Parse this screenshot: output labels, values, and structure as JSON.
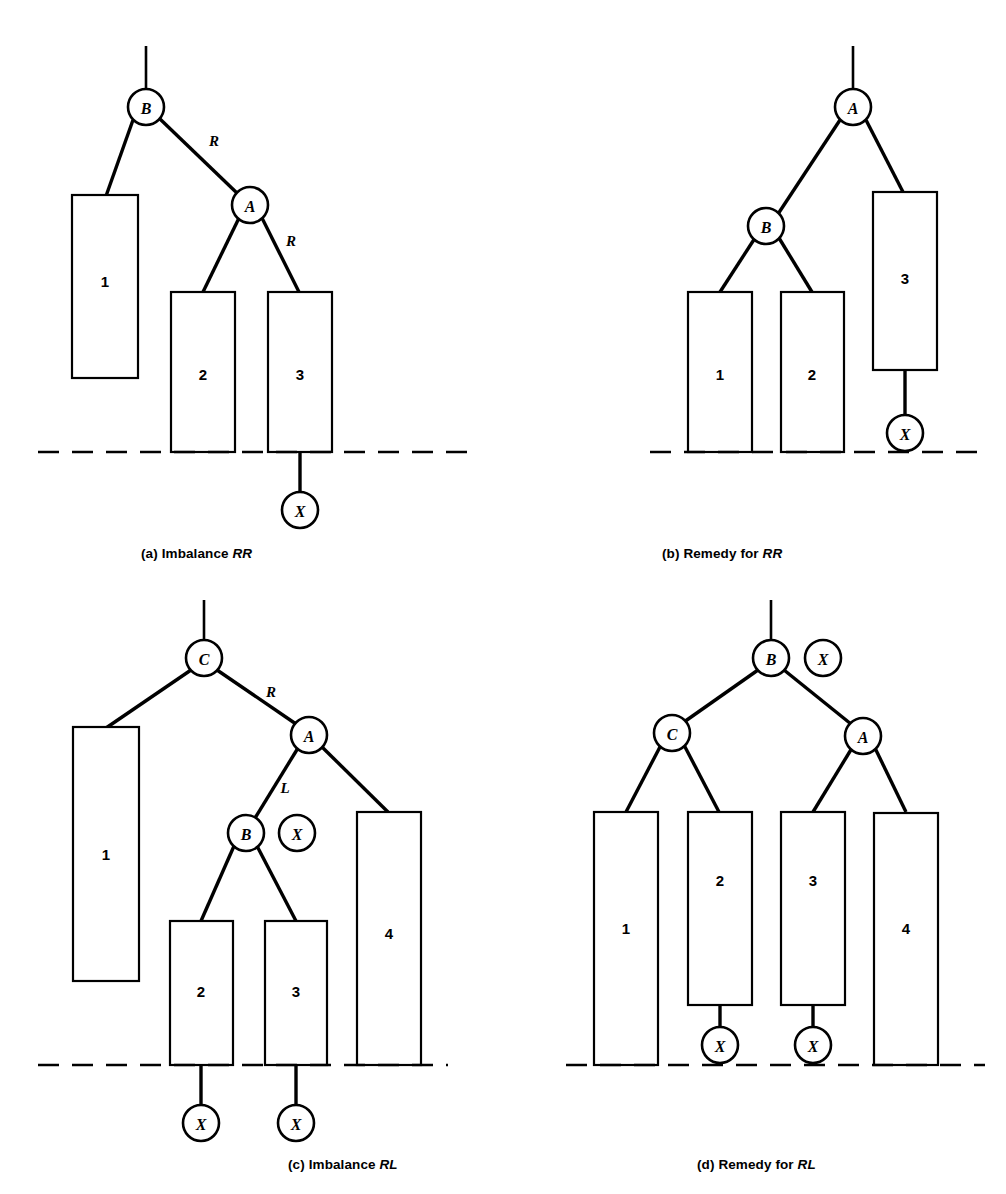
{
  "figure": {
    "type": "diagram",
    "ground_line_label": "dashed baseline"
  },
  "panels": [
    {
      "id": "a",
      "caption_prefix": "(a)",
      "caption_text": "Imbalance",
      "caption_emphasis": "RR",
      "nodes": [
        {
          "name": "B",
          "label": "B"
        },
        {
          "name": "A",
          "label": "A"
        },
        {
          "name": "X",
          "label": "X"
        }
      ],
      "edge_labels": [
        "R",
        "R"
      ],
      "boxes": [
        {
          "label": "1"
        },
        {
          "label": "2"
        },
        {
          "label": "3"
        }
      ]
    },
    {
      "id": "b",
      "caption_prefix": "(b)",
      "caption_text": "Remedy for",
      "caption_emphasis": "RR",
      "nodes": [
        {
          "name": "A",
          "label": "A"
        },
        {
          "name": "B",
          "label": "B"
        },
        {
          "name": "X",
          "label": "X"
        }
      ],
      "edge_labels": [],
      "boxes": [
        {
          "label": "1"
        },
        {
          "label": "2"
        },
        {
          "label": "3"
        }
      ]
    },
    {
      "id": "c",
      "caption_prefix": "(c)",
      "caption_text": "Imbalance",
      "caption_emphasis": "RL",
      "nodes": [
        {
          "name": "C",
          "label": "C"
        },
        {
          "name": "A",
          "label": "A"
        },
        {
          "name": "B",
          "label": "B"
        },
        {
          "name": "X-side",
          "label": "X"
        },
        {
          "name": "X-left",
          "label": "X"
        },
        {
          "name": "X-right",
          "label": "X"
        }
      ],
      "edge_labels": [
        "R",
        "L"
      ],
      "boxes": [
        {
          "label": "1"
        },
        {
          "label": "2"
        },
        {
          "label": "3"
        },
        {
          "label": "4"
        }
      ]
    },
    {
      "id": "d",
      "caption_prefix": "(d)",
      "caption_text": "Remedy for",
      "caption_emphasis": "RL",
      "nodes": [
        {
          "name": "B",
          "label": "B"
        },
        {
          "name": "X-side",
          "label": "X"
        },
        {
          "name": "C",
          "label": "C"
        },
        {
          "name": "A",
          "label": "A"
        },
        {
          "name": "X-left",
          "label": "X"
        },
        {
          "name": "X-right",
          "label": "X"
        }
      ],
      "edge_labels": [],
      "boxes": [
        {
          "label": "1"
        },
        {
          "label": "2"
        },
        {
          "label": "3"
        },
        {
          "label": "4"
        }
      ]
    }
  ],
  "colors": {
    "stroke": "#000000",
    "fill": "#ffffff",
    "text": "#000000"
  }
}
